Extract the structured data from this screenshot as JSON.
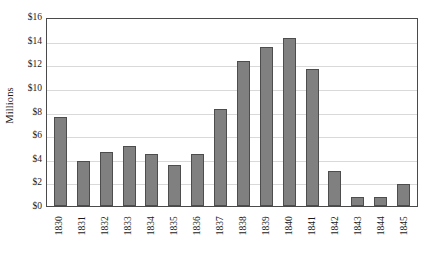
{
  "chart_data": {
    "type": "bar",
    "title": "",
    "xlabel": "",
    "ylabel": "Millions",
    "categories": [
      "1830",
      "1831",
      "1832",
      "1833",
      "1834",
      "1835",
      "1836",
      "1837",
      "1838",
      "1839",
      "1840",
      "1841",
      "1842",
      "1843",
      "1844",
      "1845"
    ],
    "values": [
      7.5,
      3.8,
      4.6,
      5.1,
      4.4,
      3.5,
      4.4,
      8.2,
      12.3,
      13.5,
      14.2,
      11.6,
      3.0,
      0.8,
      0.8,
      1.9
    ],
    "ylim": [
      0,
      16
    ],
    "ytick_values": [
      0,
      2,
      4,
      6,
      8,
      10,
      12,
      14,
      16
    ],
    "ytick_labels": [
      "$0",
      "$2",
      "$4",
      "$6",
      "$8",
      "$10",
      "$12",
      "$14",
      "$16"
    ],
    "grid": true,
    "legend": false,
    "bar_color": "#808080",
    "bar_edge_color": "#4d4d4d",
    "grid_color": "#d9d9d9",
    "axis_color": "#4a4a4a"
  }
}
